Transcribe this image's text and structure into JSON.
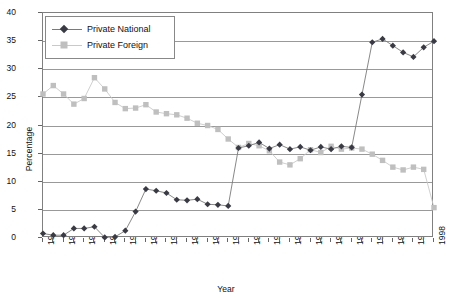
{
  "chart_data": {
    "type": "line",
    "title": "",
    "xlabel": "Year",
    "ylabel": "Percentage",
    "ylim": [
      0,
      40
    ],
    "ytick_step": 5,
    "yticks": [
      0,
      5,
      10,
      15,
      20,
      25,
      30,
      35,
      40
    ],
    "xlim": [
      1960,
      1998
    ],
    "grid": true,
    "legend_position": "top-left",
    "x": [
      1960,
      1961,
      1962,
      1963,
      1964,
      1965,
      1966,
      1967,
      1968,
      1969,
      1970,
      1971,
      1972,
      1973,
      1974,
      1975,
      1976,
      1977,
      1978,
      1979,
      1980,
      1981,
      1982,
      1983,
      1984,
      1985,
      1986,
      1987,
      1988,
      1989,
      1990,
      1991,
      1992,
      1993,
      1994,
      1995,
      1996,
      1997,
      1998
    ],
    "xtick_labels": [
      "1960",
      "",
      "1962",
      "",
      "1964",
      "",
      "1966",
      "",
      "1968",
      "",
      "1970",
      "",
      "1972",
      "",
      "1974",
      "",
      "1976",
      "",
      "1978",
      "",
      "1980",
      "",
      "1982",
      "",
      "1984",
      "",
      "1986",
      "",
      "1988",
      "",
      "1990",
      "",
      "1992",
      "",
      "1994",
      "",
      "1996",
      "",
      "1998"
    ],
    "xtick_labels_shown": [
      "1960",
      "1962",
      "1964",
      "1966",
      "1968",
      "1970",
      "1972",
      "1974",
      "1976",
      "1979",
      "1981",
      "1983",
      "1985",
      "1987",
      "1989",
      "1991",
      "1993",
      "1995",
      "1997"
    ],
    "series": [
      {
        "name": "Private National",
        "marker": "diamond",
        "color": "#3a3a44",
        "line_color": "#7a7a7a",
        "values": [
          0.8,
          0.5,
          0.5,
          1.7,
          1.7,
          2.0,
          0.1,
          0.2,
          1.3,
          4.7,
          8.7,
          8.4,
          8.0,
          6.8,
          6.7,
          6.9,
          6.0,
          5.9,
          5.7,
          16.0,
          16.4,
          17.0,
          15.9,
          16.6,
          15.8,
          16.2,
          15.6,
          16.2,
          15.8,
          16.3,
          16.1,
          25.5,
          34.8,
          35.4,
          34.2,
          33.0,
          32.2,
          33.9,
          35.0
        ]
      },
      {
        "name": "Private Foreign",
        "marker": "square",
        "color": "#bfbfbf",
        "line_color": "#c9c9c9",
        "values": [
          25.6,
          27.1,
          25.6,
          23.8,
          24.8,
          28.5,
          26.5,
          24.1,
          23.0,
          23.1,
          23.7,
          22.4,
          22.1,
          21.9,
          21.3,
          20.4,
          20.0,
          19.3,
          17.6,
          16.1,
          16.8,
          16.4,
          15.5,
          13.5,
          13.0,
          14.1,
          15.7,
          15.2,
          16.3,
          15.8,
          16.0,
          15.8,
          14.9,
          13.8,
          12.6,
          12.1,
          12.6,
          12.2,
          5.4
        ]
      }
    ]
  },
  "legend": {
    "items": [
      {
        "label": "Private National"
      },
      {
        "label": "Private Foreign"
      }
    ]
  }
}
